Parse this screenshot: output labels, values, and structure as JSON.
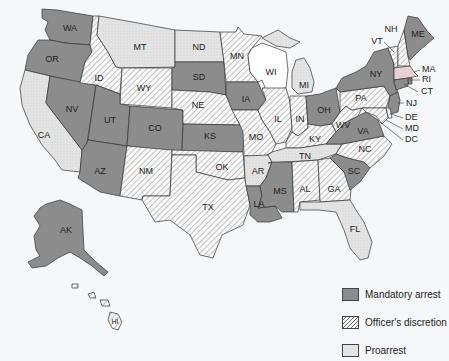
{
  "colors": {
    "mandatory": "#8c8c8c",
    "discretion_bg": "#fbfbfb",
    "discretion_hatch": "#666666",
    "proarrest": "#e4e4e4",
    "proarrest_ma": "#e8d4d8",
    "none": "#ffffff",
    "background": "#f6f7f8"
  },
  "legend": [
    {
      "key": "mandatory",
      "label": "Mandatory arrest"
    },
    {
      "key": "discretion",
      "label": "Officer's discretion"
    },
    {
      "key": "proarrest",
      "label": "Proarrest"
    }
  ],
  "states": {
    "WA": {
      "label": "WA",
      "category": "mandatory"
    },
    "OR": {
      "label": "OR",
      "category": "mandatory"
    },
    "CA": {
      "label": "CA",
      "category": "proarrest"
    },
    "NV": {
      "label": "NV",
      "category": "mandatory"
    },
    "ID": {
      "label": "ID",
      "category": "discretion"
    },
    "MT": {
      "label": "MT",
      "category": "proarrest"
    },
    "WY": {
      "label": "WY",
      "category": "discretion"
    },
    "UT": {
      "label": "UT",
      "category": "mandatory"
    },
    "AZ": {
      "label": "AZ",
      "category": "mandatory"
    },
    "CO": {
      "label": "CO",
      "category": "mandatory"
    },
    "NM": {
      "label": "NM",
      "category": "discretion"
    },
    "ND": {
      "label": "ND",
      "category": "proarrest"
    },
    "SD": {
      "label": "SD",
      "category": "mandatory"
    },
    "NE": {
      "label": "NE",
      "category": "discretion"
    },
    "KS": {
      "label": "KS",
      "category": "mandatory"
    },
    "OK": {
      "label": "OK",
      "category": "discretion"
    },
    "TX": {
      "label": "TX",
      "category": "discretion"
    },
    "MN": {
      "label": "MN",
      "category": "discretion"
    },
    "IA": {
      "label": "IA",
      "category": "mandatory"
    },
    "MO": {
      "label": "MO",
      "category": "discretion"
    },
    "AR": {
      "label": "AR",
      "category": "proarrest"
    },
    "LA": {
      "label": "LA",
      "category": "mandatory"
    },
    "WI": {
      "label": "WI",
      "category": "none"
    },
    "IL": {
      "label": "IL",
      "category": "discretion"
    },
    "MI": {
      "label": "MI",
      "category": "proarrest"
    },
    "IN": {
      "label": "IN",
      "category": "discretion"
    },
    "OH": {
      "label": "OH",
      "category": "mandatory"
    },
    "KY": {
      "label": "KY",
      "category": "discretion"
    },
    "TN": {
      "label": "TN",
      "category": "proarrest"
    },
    "MS": {
      "label": "MS",
      "category": "mandatory"
    },
    "AL": {
      "label": "AL",
      "category": "discretion"
    },
    "GA": {
      "label": "GA",
      "category": "discretion"
    },
    "FL": {
      "label": "FL",
      "category": "proarrest"
    },
    "SC": {
      "label": "SC",
      "category": "mandatory"
    },
    "NC": {
      "label": "NC",
      "category": "discretion"
    },
    "VA": {
      "label": "VA",
      "category": "mandatory"
    },
    "WV": {
      "label": "WV",
      "category": "discretion"
    },
    "PA": {
      "label": "PA",
      "category": "discretion"
    },
    "NY": {
      "label": "NY",
      "category": "mandatory"
    },
    "VT": {
      "label": "VT",
      "category": "discretion"
    },
    "NH": {
      "label": "NH",
      "category": "discretion"
    },
    "ME": {
      "label": "ME",
      "category": "mandatory"
    },
    "MA": {
      "label": "MA",
      "category": "proarrest"
    },
    "RI": {
      "label": "RI",
      "category": "mandatory"
    },
    "CT": {
      "label": "CT",
      "category": "mandatory"
    },
    "NJ": {
      "label": "NJ",
      "category": "mandatory"
    },
    "DE": {
      "label": "DE",
      "category": "discretion"
    },
    "MD": {
      "label": "MD",
      "category": "discretion"
    },
    "DC": {
      "label": "DC",
      "category": "discretion"
    },
    "AK": {
      "label": "AK",
      "category": "mandatory"
    },
    "HI": {
      "label": "HI",
      "category": "discretion"
    }
  }
}
